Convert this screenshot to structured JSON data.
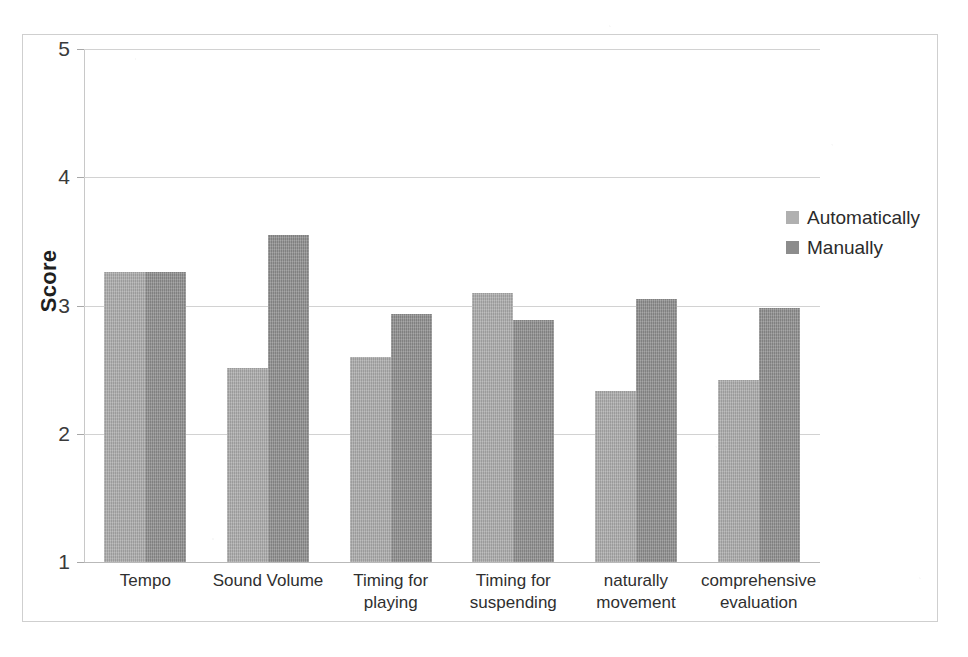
{
  "chart_data": {
    "type": "bar",
    "title": "",
    "subtitle": "",
    "xlabel": "",
    "ylabel": "Score",
    "ylim": [
      1,
      5
    ],
    "yticks": [
      "1",
      "2",
      "3",
      "4",
      "5"
    ],
    "grid": true,
    "legend_position": "right",
    "categories": [
      "Tempo",
      "Sound Volume",
      "Timing for playing",
      "Timing for suspending",
      "naturally movement",
      "comprehensive evaluation"
    ],
    "series": [
      {
        "name": "Automatically",
        "color": "#a9a9a9",
        "values": [
          3.26,
          2.51,
          2.6,
          3.1,
          2.33,
          2.42
        ]
      },
      {
        "name": "Manually",
        "color": "#8f8f8f",
        "values": [
          3.26,
          3.55,
          2.93,
          2.89,
          3.05,
          2.98
        ]
      }
    ]
  },
  "axis": {
    "y_title": "Score",
    "y_tick_labels": [
      "5",
      "4",
      "3",
      "2",
      "1"
    ]
  },
  "legend": {
    "entries": [
      {
        "label": "Automatically",
        "swatch": "series-auto"
      },
      {
        "label": "Manually",
        "swatch": "series-manual"
      }
    ]
  },
  "category_labels": [
    {
      "line1": "Tempo",
      "line2": ""
    },
    {
      "line1": "Sound Volume",
      "line2": ""
    },
    {
      "line1": "Timing for",
      "line2": "playing"
    },
    {
      "line1": "Timing for",
      "line2": "suspending"
    },
    {
      "line1": "naturally",
      "line2": "movement"
    },
    {
      "line1": "comprehensive",
      "line2": "evaluation"
    }
  ]
}
